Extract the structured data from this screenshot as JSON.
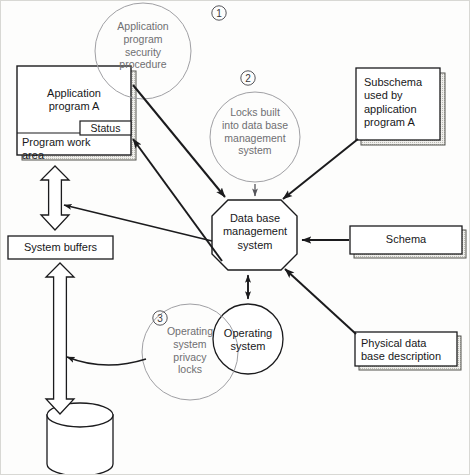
{
  "diagram": {
    "type": "flow-diagram",
    "colors": {
      "ink": "#18181a",
      "dim_ink": "#6f6f72",
      "line": "#1b1b1d",
      "faint_line": "#8a8a8e",
      "shadow": "#c9c9c4",
      "background": "#fdfdfc",
      "frame": "#d8d8d4"
    },
    "nodes": {
      "application_program": {
        "label": "Application\nprogram A",
        "shape": "stacked-box",
        "status_label": "Status",
        "work_area_label": "Program work\narea"
      },
      "system_buffers": {
        "label": "System buffers",
        "shape": "box"
      },
      "storage": {
        "label": "",
        "shape": "cylinder"
      },
      "dbms": {
        "label": "Data base\nmanagement\nsystem",
        "shape": "octagon"
      },
      "operating_system": {
        "label": "Operating\nsystem",
        "shape": "circle"
      },
      "subschema": {
        "label": "Subschema\nused by\napplication\nprogram A",
        "shape": "stacked-box"
      },
      "schema": {
        "label": "Schema",
        "shape": "stacked-box"
      },
      "physical_db_description": {
        "label": "Physical data\nbase description",
        "shape": "stacked-box"
      }
    },
    "annotations": [
      {
        "number": "1",
        "label": "Application\nprogram\nsecurity\nprocedure",
        "shape": "circle-callout"
      },
      {
        "number": "2",
        "label": "Locks built\ninto data base\nmanagement\nsystem",
        "shape": "circle-callout"
      },
      {
        "number": "3",
        "label": "Operating\nsystem\nprivacy\nlocks",
        "shape": "circle-callout"
      }
    ],
    "connections": [
      {
        "from": "application_program",
        "to": "dbms",
        "style": "solid-arrow"
      },
      {
        "from": "dbms",
        "to": "application_program",
        "style": "solid-arrow"
      },
      {
        "from": "dbms",
        "to": "application_program_buffer_path",
        "style": "thin-arrow"
      },
      {
        "from": "application_program",
        "to": "system_buffers",
        "style": "hollow-double-arrow"
      },
      {
        "from": "system_buffers",
        "to": "storage",
        "style": "hollow-double-arrow"
      },
      {
        "from": "subschema",
        "to": "dbms",
        "style": "solid-arrow"
      },
      {
        "from": "schema",
        "to": "dbms",
        "style": "solid-arrow"
      },
      {
        "from": "physical_db_description",
        "to": "dbms",
        "style": "solid-arrow"
      },
      {
        "from": "dbms",
        "to": "operating_system",
        "style": "double-arrow"
      },
      {
        "from": "annotation_2",
        "to": "dbms",
        "style": "thin-arrow"
      },
      {
        "from": "annotation_3",
        "to": "storage_path",
        "style": "curved-thin-arrow"
      }
    ]
  }
}
